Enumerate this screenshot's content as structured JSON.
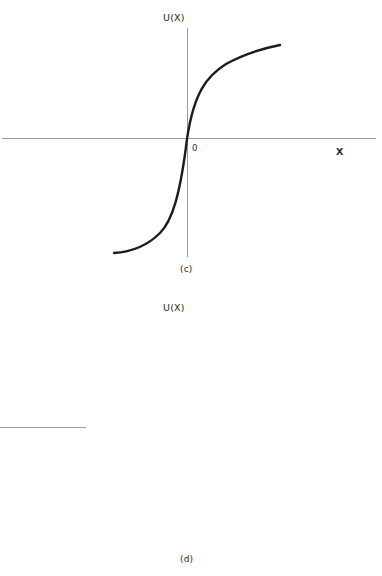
{
  "figure": {
    "background_color": "#ffffff",
    "axis_color": "#9a9a9a",
    "curve_color": "#1c1c1c"
  },
  "panels": [
    {
      "id": "c",
      "caption": "(c)",
      "y_axis_label": "U(X)",
      "x_axis_label": "X",
      "origin_label": "0"
    },
    {
      "id": "d",
      "caption": "(d)",
      "y_axis_label": "U(X)",
      "x_axis_label": "X",
      "origin_label": "0"
    }
  ],
  "chart_data": [
    {
      "type": "line",
      "title": "(c)",
      "xlabel": "X",
      "ylabel": "U(X)",
      "grid": false,
      "legend": "none",
      "annotations": [
        "0"
      ],
      "axis_style": "cartesian-cross-through-origin",
      "description": "Concave-convex S-shaped utility curve: convex (steep rising) for negative X, passing through origin, then concave (flattening) for positive X.",
      "xlim": [
        -1.0,
        1.3
      ],
      "ylim": [
        -1.25,
        1.25
      ],
      "x": [
        -1.0,
        -0.9,
        -0.8,
        -0.7,
        -0.6,
        -0.5,
        -0.42,
        -0.34,
        -0.26,
        -0.18,
        -0.1,
        -0.04,
        0.0,
        0.05,
        0.12,
        0.2,
        0.3,
        0.45,
        0.6,
        0.8,
        1.0,
        1.2,
        1.28
      ],
      "y": [
        -1.18,
        -1.15,
        -1.1,
        -1.03,
        -0.93,
        -0.8,
        -0.66,
        -0.5,
        -0.34,
        -0.2,
        -0.09,
        -0.03,
        0.0,
        0.06,
        0.16,
        0.29,
        0.42,
        0.56,
        0.68,
        0.82,
        0.96,
        1.1,
        1.16
      ],
      "curve_path_svg": "M 114,253 C 131,252 147,246 160,233 C 172,221 180,196 187,139 C 194,92 207,76 226,64 C 244,54 265,48 280,45"
    },
    {
      "type": "line",
      "title": "(d)",
      "xlabel": "X",
      "ylabel": "U(X)",
      "grid": false,
      "legend": "none",
      "annotations": [
        "0"
      ],
      "axis_style": "cartesian-cross-through-origin",
      "description": "Inverse S-shaped utility curve: steep for large negative X, flattening through the origin region, then steepening again for large positive X.",
      "xlim": [
        -1.0,
        1.3
      ],
      "ylim": [
        -1.25,
        1.25
      ],
      "x": [
        -1.0,
        -0.92,
        -0.84,
        -0.76,
        -0.68,
        -0.58,
        -0.48,
        -0.38,
        -0.26,
        -0.14,
        -0.05,
        0.0,
        0.08,
        0.2,
        0.34,
        0.5,
        0.66,
        0.8,
        0.95,
        1.1,
        1.22,
        1.28
      ],
      "y": [
        -1.18,
        -1.02,
        -0.87,
        -0.73,
        -0.6,
        -0.47,
        -0.36,
        -0.27,
        -0.17,
        -0.08,
        -0.03,
        0.0,
        0.04,
        0.1,
        0.17,
        0.24,
        0.32,
        0.42,
        0.6,
        0.84,
        1.05,
        1.15
      ],
      "curve_path_svg": "M 115,516 C 124,500 134,481 145,468 C 156,455 168,442 187,427 C 206,413 223,406 240,398 C 252,392 258,386 263,376 C 269,366 275,358 281,352"
    }
  ]
}
